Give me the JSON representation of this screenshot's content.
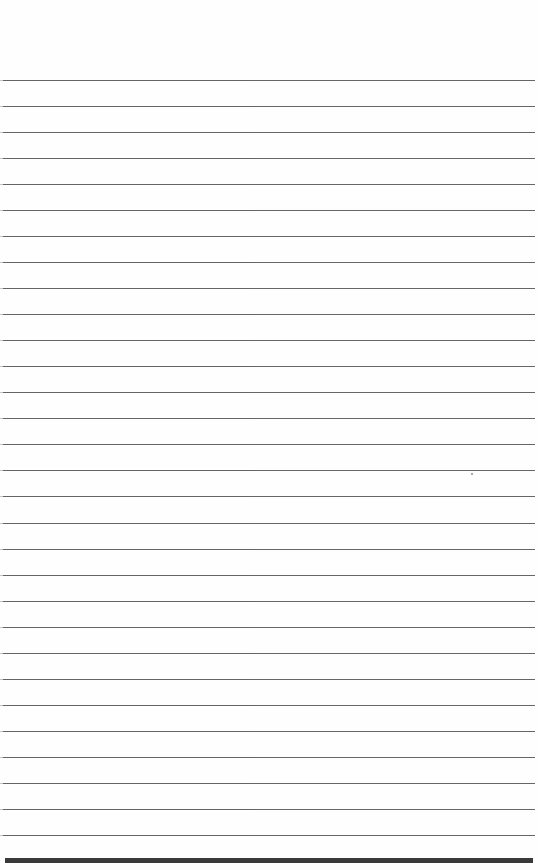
{
  "page": {
    "type": "lined-paper",
    "background": "#fefefe",
    "line_color": "#555555",
    "rule_count": 30,
    "first_rule_y": 80,
    "rule_spacing": 26.03,
    "bottom_strip_color": "#3a3a3a"
  }
}
